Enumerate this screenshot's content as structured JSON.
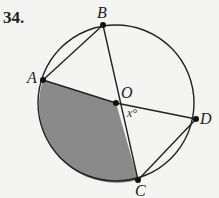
{
  "problem": {
    "number": "34."
  },
  "diagram": {
    "circle": {
      "cx": 116,
      "cy": 103,
      "r": 78
    },
    "points": {
      "A": {
        "label": "A",
        "x": 43,
        "y": 80
      },
      "B": {
        "label": "B",
        "x": 103,
        "y": 25
      },
      "O": {
        "label": "O",
        "x": 116,
        "y": 103
      },
      "D": {
        "label": "D",
        "x": 196,
        "y": 119
      },
      "C": {
        "label": "C",
        "x": 138,
        "y": 180
      }
    },
    "angle_label": "x°",
    "shaded_region": "sector AOC",
    "colors": {
      "shade": "#8a8a8a",
      "stroke": "#222222"
    }
  }
}
